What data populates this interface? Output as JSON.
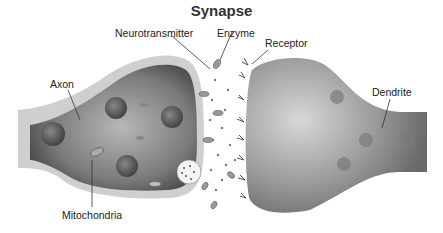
{
  "title": "Synapse",
  "labels": {
    "neurotransmitter": "Neurotransmitter",
    "enzyme": "Enzyme",
    "receptor": "Receptor",
    "axon": "Axon",
    "dendrite": "Dendrite",
    "mitochondria": "Mitochondria"
  },
  "colors": {
    "axon_fill": "#6e6e6e",
    "dendrite_fill": "#8a8a8a",
    "background": "#ffffff"
  }
}
